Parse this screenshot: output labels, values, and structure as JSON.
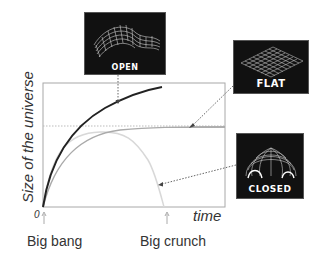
{
  "diagram": {
    "y_axis_label": "Size of the universe",
    "x_axis_label": "time",
    "origin_label": "0",
    "markers": [
      {
        "label": "Big bang"
      },
      {
        "label": "Big crunch"
      }
    ],
    "panels": {
      "open": {
        "label": "OPEN",
        "icon": "saddle-surface-icon"
      },
      "flat": {
        "label": "FLAT",
        "icon": "flat-grid-icon"
      },
      "closed": {
        "label": "CLOSED",
        "icon": "sphere-dome-icon"
      }
    },
    "colors": {
      "open_curve": "#222222",
      "flat_curve": "#aaaaaa",
      "closed_curve": "#d8d8d8",
      "panel_bg": "#111111",
      "frame": "#999999"
    }
  }
}
